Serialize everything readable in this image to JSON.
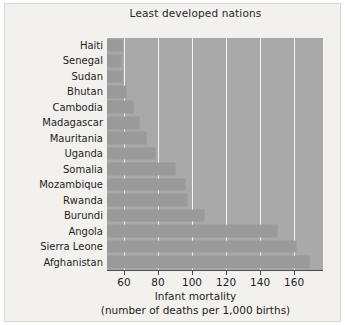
{
  "chart_data": {
    "type": "bar",
    "orientation": "horizontal",
    "title": "Least developed nations",
    "xlabel_line1": "Infant mortality",
    "xlabel_line2": "(number of deaths per 1,000 births)",
    "ylabel": "",
    "categories": [
      "Haiti",
      "Senegal",
      "Sudan",
      "Bhutan",
      "Cambodia",
      "Madagascar",
      "Mauritania",
      "Uganda",
      "Somalia",
      "Mozambique",
      "Rwanda",
      "Burundi",
      "Angola",
      "Sierra Leone",
      "Afghanistan"
    ],
    "values": [
      59,
      58,
      59,
      61,
      65,
      69,
      73,
      78,
      90,
      96,
      97,
      107,
      150,
      161,
      169
    ],
    "xlim": [
      50,
      177
    ],
    "xticks": [
      60,
      80,
      100,
      120,
      140,
      160
    ],
    "xticklabels": [
      "60",
      "80",
      "100",
      "120",
      "140",
      "160"
    ],
    "grid": "vertical",
    "legend": "none",
    "colors": {
      "plot_background": "#a9a9a9",
      "bar_fill": "#9a9a9a",
      "gridline": "#f3f3f1",
      "figure_background": "#f2f1ee",
      "text": "#1d1d1d"
    }
  }
}
